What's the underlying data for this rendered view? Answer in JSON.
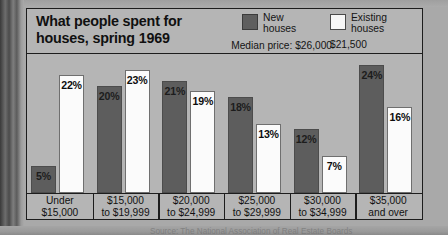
{
  "title": {
    "line1": "What people spent for",
    "line2": "houses, spring 1969"
  },
  "legend": {
    "new": {
      "label_line1": "New",
      "label_line2": "houses",
      "swatch_color": "#5d5d5d"
    },
    "existing": {
      "label_line1": "Existing",
      "label_line2": "houses",
      "swatch_color": "#fbfbfb"
    },
    "median_new": "Median price: $26,000",
    "median_existing": "$21,500"
  },
  "source": "Source: The National Association of Real Estate Boards",
  "chart_data": {
    "type": "bar",
    "title": "What people spent for houses, spring 1969",
    "xlabel": "",
    "ylabel": "",
    "ylim": [
      0,
      26
    ],
    "grid": false,
    "legend_position": "top-right",
    "value_suffix": "%",
    "categories": [
      "Under $15,000",
      "$15,000 to $19,999",
      "$20,000 to $24,999",
      "$25,000 to $29,999",
      "$30,000 to $34,999",
      "$35,000 and over"
    ],
    "category_lines": [
      {
        "line1": "Under",
        "line2": "$15,000"
      },
      {
        "line1": "$15,000",
        "line2": "to $19,999"
      },
      {
        "line1": "$20,000",
        "line2": "to $24,999"
      },
      {
        "line1": "$25,000",
        "line2": "to $29,999"
      },
      {
        "line1": "$30,000",
        "line2": "to $34,999"
      },
      {
        "line1": "$35,000",
        "line2": "and over"
      }
    ],
    "series": [
      {
        "name": "New houses",
        "color": "#5d5d5d",
        "values": [
          5,
          20,
          21,
          18,
          12,
          24
        ],
        "labels": [
          "5%",
          "20%",
          "21%",
          "18%",
          "12%",
          "24%"
        ]
      },
      {
        "name": "Existing houses",
        "color": "#fbfbfb",
        "values": [
          22,
          23,
          19,
          13,
          7,
          16
        ],
        "labels": [
          "22%",
          "23%",
          "19%",
          "13%",
          "7%",
          "16%"
        ]
      }
    ]
  }
}
